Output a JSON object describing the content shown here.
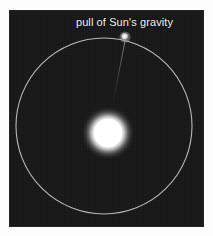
{
  "diagram": {
    "title": "pull of Sun's gravity",
    "background_color": "#161616",
    "page_color": "#ffffff",
    "orbit_color": "#c8c8c8",
    "sun_color": "#ffffff",
    "planet_color": "#e8e8e8",
    "label_color": "#f2f2f2",
    "force_line_color": "#6a6a6a"
  },
  "labels": {
    "gravity_pull": "pull of Sun's gravity"
  },
  "objects": {
    "sun": {
      "name": "Sun",
      "cx": 99,
      "cy": 123,
      "core_radius": 15,
      "glow_radius": 27
    },
    "planet": {
      "name": "planet",
      "cx": 116,
      "cy": 27,
      "radius": 4
    },
    "orbit": {
      "name": "orbit path",
      "cx": 95,
      "cy": 116,
      "radius": 88,
      "stroke_width": 1.1
    },
    "force_line": {
      "name": "gravity force vector",
      "x1": 116,
      "y1": 31,
      "x2": 103,
      "y2": 98
    }
  }
}
